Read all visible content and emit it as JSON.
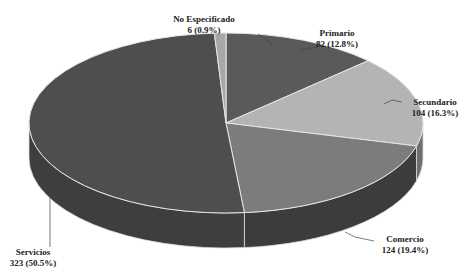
{
  "chart_data": {
    "type": "pie",
    "style": "3d",
    "title": "",
    "categories": [
      "Primario",
      "Secundario",
      "Comercio",
      "Servicios",
      "No Especificado"
    ],
    "values": [
      82,
      104,
      124,
      323,
      6
    ],
    "percentages": [
      12.8,
      16.3,
      19.4,
      50.5,
      0.9
    ],
    "labels": [
      {
        "name": "Primario",
        "value_text": "82 (12.8%)"
      },
      {
        "name": "Secundario",
        "value_text": "104 (16.3%)"
      },
      {
        "name": "Comercio",
        "value_text": "124 (19.4%)"
      },
      {
        "name": "Servicios",
        "value_text": "323 (50.5%)"
      },
      {
        "name": "No Especificado",
        "value_text": "6 (0.9%)"
      }
    ],
    "colors": [
      "#5a5a5a",
      "#b4b4b4",
      "#7c7c7c",
      "#4e4e4e",
      "#a8a8a8"
    ],
    "side_colors": [
      "#3a3a3a",
      "#6e6e6e",
      "#3c3c3c",
      "#3e3e3e",
      "#6a6a6a"
    ],
    "legend": "none",
    "start_angle_deg": 0,
    "direction": "clockwise"
  }
}
